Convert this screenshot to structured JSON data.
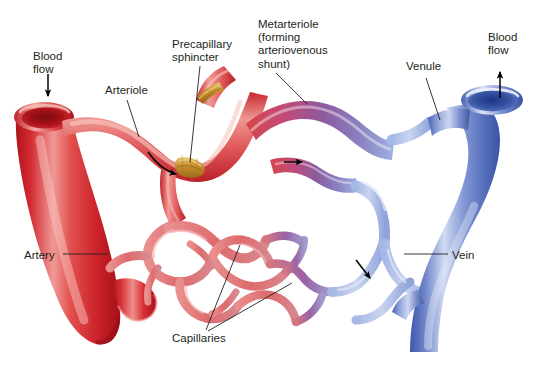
{
  "figure": {
    "background_color": "#ffffff",
    "width": 538,
    "height": 372
  },
  "colors": {
    "artery_red": "#d93036",
    "artery_red_dark": "#b3141d",
    "artery_red_light": "#ef8a8b",
    "arteriole_pink": "#e5736f",
    "capillary_pink": "#e48a8c",
    "metarteriole_purple": "#8c5a9e",
    "venule_blue": "#9aaee0",
    "vein_blue": "#4f69b8",
    "vein_blue_dark": "#2f4a9e",
    "vein_blue_light": "#c3cfee",
    "sphincter_tan": "#c8922f",
    "label_text": "#231f20",
    "leader_line": "#231f20",
    "arrow": "#000000"
  },
  "labels": [
    {
      "id": "blood-flow-left",
      "name": "blood-flow-in-label",
      "text": "Blood\nflow",
      "x": 33,
      "y": 50,
      "align": "left"
    },
    {
      "id": "arteriole",
      "name": "arteriole-label",
      "text": "Arteriole",
      "x": 105,
      "y": 84,
      "align": "left"
    },
    {
      "id": "precapillary-sphincter",
      "name": "precapillary-sphincter-label",
      "text": "Precapillary\nsphincter",
      "x": 172,
      "y": 38,
      "align": "left"
    },
    {
      "id": "metarteriole",
      "name": "metarteriole-label",
      "text": "Metarteriole\n(forming\narteriovenous\nshunt)",
      "x": 258,
      "y": 18,
      "align": "left"
    },
    {
      "id": "venule",
      "name": "venule-label",
      "text": "Venule",
      "x": 406,
      "y": 60,
      "align": "left"
    },
    {
      "id": "blood-flow-right",
      "name": "blood-flow-out-label",
      "text": "Blood\nflow",
      "x": 488,
      "y": 31,
      "align": "left"
    },
    {
      "id": "artery",
      "name": "artery-label",
      "text": "Artery",
      "x": 24,
      "y": 249,
      "align": "left"
    },
    {
      "id": "capillaries",
      "name": "capillaries-label",
      "text": "Capillaries",
      "x": 172,
      "y": 332,
      "align": "left"
    },
    {
      "id": "vein",
      "name": "vein-label",
      "text": "Vein",
      "x": 452,
      "y": 249,
      "align": "left"
    }
  ],
  "leader_lines": [
    {
      "name": "leader-arteriole",
      "from": [
        127,
        100
      ],
      "to": [
        139,
        137
      ]
    },
    {
      "name": "leader-precapillary-sphincter",
      "from": [
        200,
        66
      ],
      "to": [
        190,
        162
      ]
    },
    {
      "name": "leader-metarteriole",
      "from": [
        276,
        73
      ],
      "to": [
        307,
        104
      ]
    },
    {
      "name": "leader-venule",
      "from": [
        426,
        78
      ],
      "to": [
        440,
        120
      ]
    },
    {
      "name": "leader-artery",
      "from": [
        63,
        254
      ],
      "to": [
        108,
        254
      ]
    },
    {
      "name": "leader-vein",
      "from": [
        404,
        254
      ],
      "to": [
        448,
        254
      ]
    },
    {
      "name": "leader-capillaries-1",
      "from": [
        206,
        330
      ],
      "to": [
        240,
        245
      ]
    },
    {
      "name": "leader-capillaries-2",
      "from": [
        208,
        331
      ],
      "to": [
        290,
        283
      ]
    }
  ],
  "flow_arrows": [
    {
      "name": "flow-arrow-inlet",
      "type": "straight",
      "direction": "down",
      "x": 48,
      "y": 88
    },
    {
      "name": "flow-arrow-outlet",
      "type": "straight",
      "direction": "up",
      "x": 500,
      "y": 86
    },
    {
      "name": "flow-arrow-arteriole-curve",
      "type": "curved",
      "direction": "down-right",
      "x": 162,
      "y": 162
    },
    {
      "name": "flow-arrow-metarteriole",
      "type": "straight",
      "direction": "right",
      "x": 292,
      "y": 162
    },
    {
      "name": "flow-arrow-venule",
      "type": "straight",
      "direction": "down-right",
      "x": 362,
      "y": 270
    }
  ],
  "vessels": [
    {
      "name": "artery-trunk",
      "label": "Artery",
      "color_key": "artery_red"
    },
    {
      "name": "arteriole-branch",
      "label": "Arteriole",
      "color_key": "arteriole_pink"
    },
    {
      "name": "precapillary-sphincter-band-upper",
      "label": "Precapillary sphincter",
      "color_key": "sphincter_tan"
    },
    {
      "name": "precapillary-sphincter-band-lower",
      "label": "Precapillary sphincter",
      "color_key": "sphincter_tan"
    },
    {
      "name": "capillary-bed",
      "label": "Capillaries",
      "color_key": "capillary_pink"
    },
    {
      "name": "metarteriole-shunt",
      "label": "Metarteriole (forming arteriovenous shunt)",
      "color_key": "metarteriole_purple"
    },
    {
      "name": "venule-branch",
      "label": "Venule",
      "color_key": "venule_blue"
    },
    {
      "name": "vein-trunk",
      "label": "Vein",
      "color_key": "vein_blue"
    }
  ]
}
